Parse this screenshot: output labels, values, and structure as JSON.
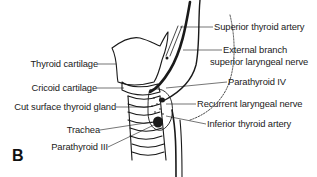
{
  "figure": {
    "panel_letter": "B",
    "left_labels": [
      {
        "text": "Thyroid cartilage"
      },
      {
        "text": "Cricoid cartilage"
      },
      {
        "text": "Cut surface thyroid gland"
      },
      {
        "text": "Trachea"
      },
      {
        "text": "Parathyroid III"
      }
    ],
    "right_labels": [
      {
        "text": "Superior thyroid artery"
      },
      {
        "text": "External branch"
      },
      {
        "text": "superior laryngeal nerve"
      },
      {
        "text": "Parathyroid IV"
      },
      {
        "text": "Recurrent laryngeal nerve"
      },
      {
        "text": "Inferior thyroid artery"
      }
    ],
    "colors": {
      "ink": "#1a1a1a",
      "background": "#ffffff"
    }
  }
}
